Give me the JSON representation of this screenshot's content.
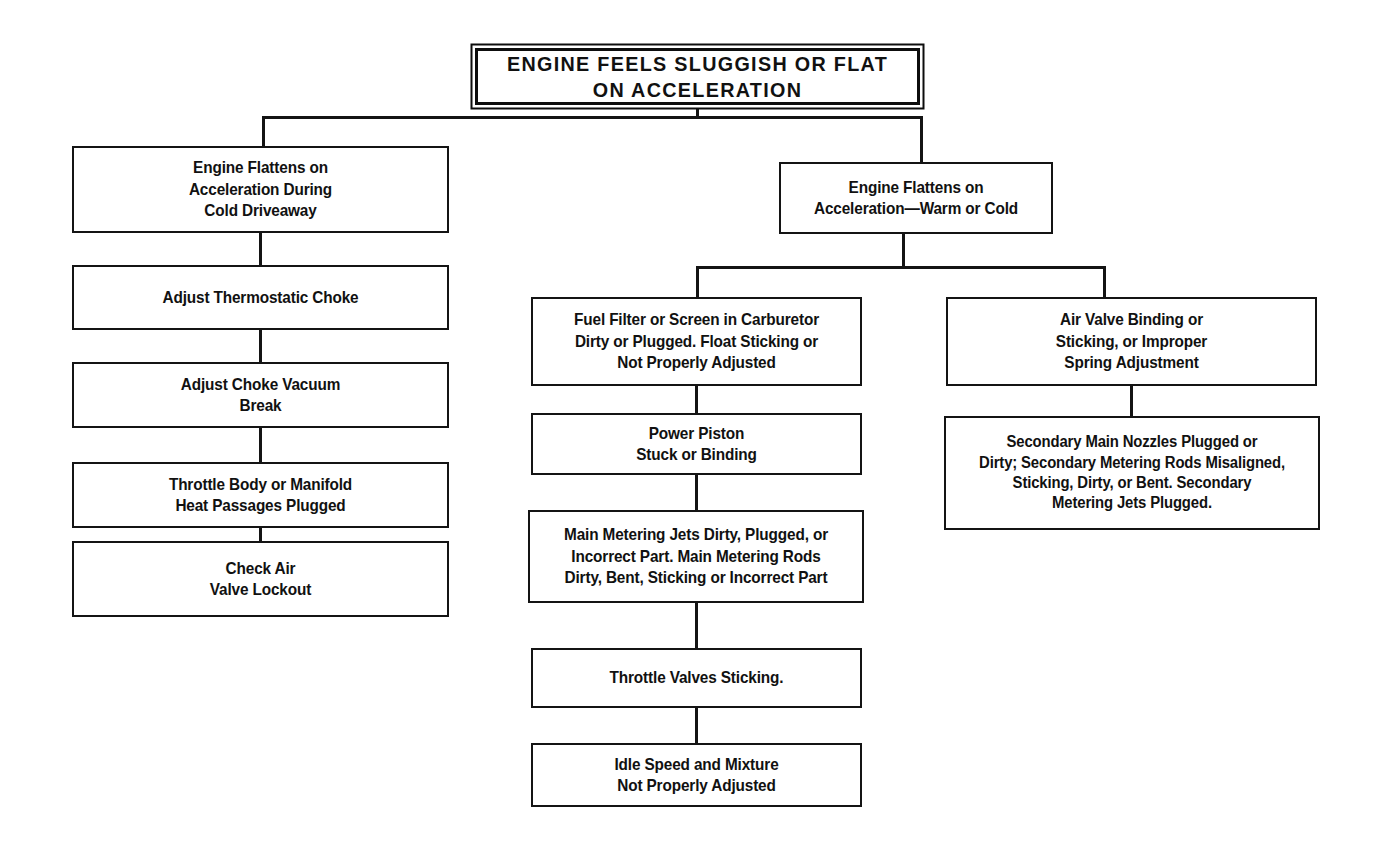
{
  "diagram": {
    "title": "ENGINE FEELS SLUGGISH OR FLAT\nON ACCELERATION",
    "type": "flowchart",
    "orientation": "top-down",
    "background_color": "#ffffff",
    "line_color": "#141414",
    "text_color": "#111111"
  },
  "nodes": {
    "root": "ENGINE FEELS SLUGGISH OR FLAT\nON ACCELERATION",
    "left": {
      "branch_head": "Engine Flattens on\nAcceleration During\nCold Driveaway",
      "steps": [
        "Adjust Thermostatic Choke",
        "Adjust Choke Vacuum\nBreak",
        "Throttle Body or Manifold\nHeat Passages Plugged",
        "Check Air\nValve Lockout"
      ]
    },
    "right": {
      "branch_head": "Engine Flattens on\nAcceleration—Warm or Cold",
      "middle_steps": [
        "Fuel Filter or Screen in Carburetor\nDirty or Plugged. Float Sticking or\nNot Properly Adjusted",
        "Power Piston\nStuck or Binding",
        "Main Metering Jets Dirty, Plugged, or\nIncorrect Part. Main Metering Rods\nDirty, Bent, Sticking or Incorrect Part",
        "Throttle Valves Sticking.",
        "Idle Speed and Mixture\nNot Properly Adjusted"
      ],
      "far_right_steps": [
        "Air Valve Binding or\nSticking, or Improper\nSpring Adjustment",
        "Secondary Main Nozzles Plugged or\nDirty; Secondary Metering Rods Misaligned,\nSticking, Dirty, or Bent. Secondary\nMetering Jets Plugged."
      ]
    }
  }
}
